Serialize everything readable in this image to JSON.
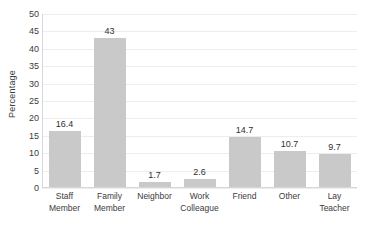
{
  "chart_data": {
    "type": "bar",
    "title": "",
    "xlabel": "",
    "ylabel": "Percentage",
    "ylim": [
      0,
      50
    ],
    "ytick_step": 5,
    "yticks": [
      50,
      45,
      40,
      35,
      30,
      25,
      20,
      15,
      10,
      5,
      0
    ],
    "grid": true,
    "legend": false,
    "bar_color": "#c9c9c9",
    "gridline_color": "#ededed",
    "text_color": "#3b3b3b",
    "categories": [
      "Staff Member",
      "Family Member",
      "Neighbor",
      "Work Colleague",
      "Friend",
      "Other",
      "Lay Teacher"
    ],
    "category_lines": [
      [
        "Staff",
        "Member"
      ],
      [
        "Family",
        "Member"
      ],
      [
        "Neighbor",
        ""
      ],
      [
        "Work",
        "Colleague"
      ],
      [
        "Friend",
        ""
      ],
      [
        "Other",
        ""
      ],
      [
        "Lay Teacher",
        ""
      ]
    ],
    "values": [
      16.4,
      43,
      1.7,
      2.6,
      14.7,
      10.7,
      9.7
    ],
    "value_labels": [
      "16.4",
      "43",
      "1.7",
      "2.6",
      "14.7",
      "10.7",
      "9.7"
    ]
  }
}
